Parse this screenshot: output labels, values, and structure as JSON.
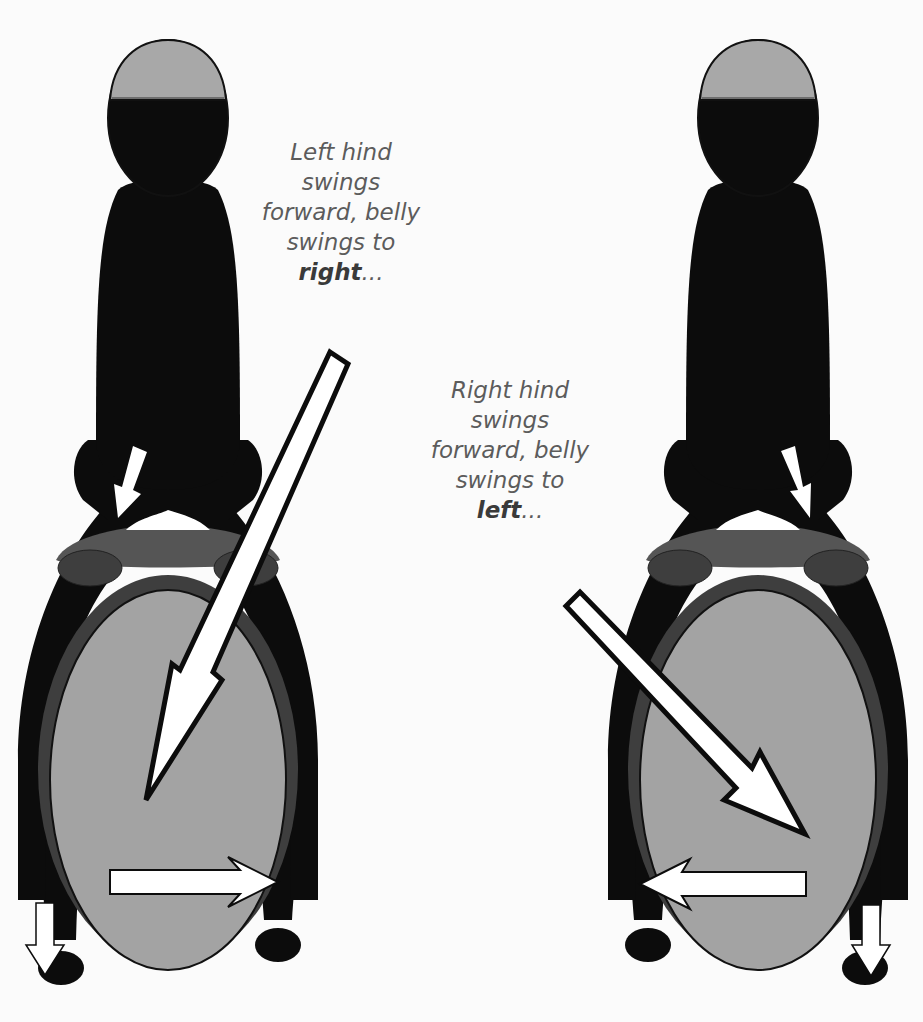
{
  "diagram": {
    "title": "",
    "colors": {
      "background": "#fbfbfb",
      "silhouette": "#0c0c0c",
      "helmet": "#a8a8a8",
      "belly": "#a3a3a3",
      "saddle": "#555555",
      "saddle_pad": "#3e3e3e",
      "arrow_fill": "#ffffff",
      "arrow_stroke": "#0c0c0c",
      "caption_text": "#5c5c5c"
    },
    "panels": [
      {
        "id": "left-panel",
        "caption": {
          "lines": [
            "Left hind",
            "swings",
            "forward, belly",
            "swings to"
          ],
          "emphasis": "right",
          "suffix": "..."
        },
        "arrows": [
          {
            "name": "rider-leg-arrow",
            "direction": "down-left"
          },
          {
            "name": "diagonal-arrow",
            "direction": "down-left",
            "from": "caption",
            "to": "belly"
          },
          {
            "name": "belly-swing-arrow",
            "direction": "right"
          },
          {
            "name": "hind-leg-arrow",
            "direction": "down",
            "leg": "left"
          }
        ]
      },
      {
        "id": "right-panel",
        "caption": {
          "lines": [
            "Right hind",
            "swings",
            "forward, belly",
            "swings to"
          ],
          "emphasis": "left",
          "suffix": "..."
        },
        "arrows": [
          {
            "name": "rider-leg-arrow",
            "direction": "down-right"
          },
          {
            "name": "diagonal-arrow",
            "direction": "down-right",
            "from": "caption",
            "to": "belly"
          },
          {
            "name": "belly-swing-arrow",
            "direction": "left"
          },
          {
            "name": "hind-leg-arrow",
            "direction": "down",
            "leg": "right"
          }
        ]
      }
    ]
  }
}
